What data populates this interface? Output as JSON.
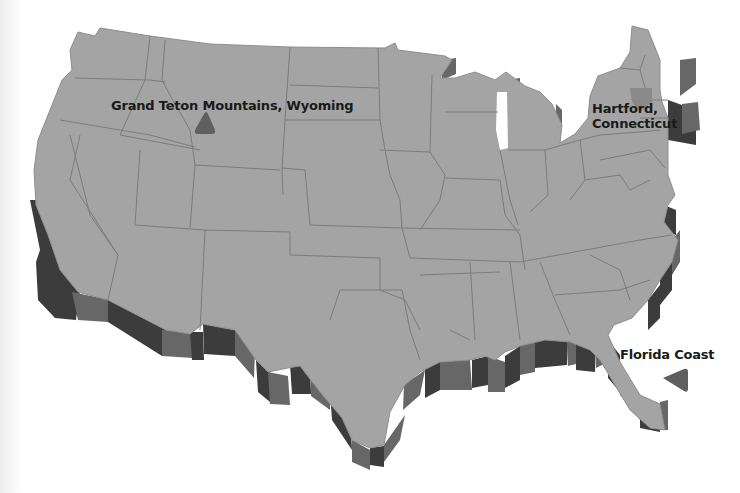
{
  "map": {
    "title": "United States locations",
    "colors": {
      "land": "#a4a4a4",
      "state_border": "#7c7c7c",
      "extrusion_dark": "#3c3c3c",
      "extrusion_mid": "#676767",
      "marker": "#5f5f5f",
      "highlight_state": "#8a8a8a",
      "label_text": "#1a1a1a"
    },
    "markers": [
      {
        "id": "grand-teton",
        "label": "Grand Teton Mountains, Wyoming",
        "shape": "triangle-up"
      },
      {
        "id": "hartford",
        "label_line1": "Hartford,",
        "label_line2": "Connecticut",
        "shape": "highlighted-state"
      },
      {
        "id": "florida-coast",
        "label": "Florida Coast",
        "shape": "triangle-left"
      }
    ]
  }
}
